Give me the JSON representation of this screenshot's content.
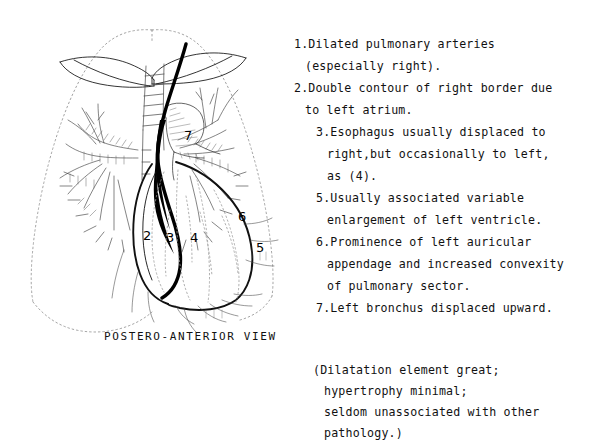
{
  "caption": "POSTERO-ANTERIOR VIEW",
  "legend": {
    "lines": [
      {
        "text": "1.Dilated pulmonary arteries",
        "indent": 0
      },
      {
        "text": "(especially right).",
        "indent": 1
      },
      {
        "text": "2.Double contour of right border due",
        "indent": 0
      },
      {
        "text": "to left atrium.",
        "indent": 1
      },
      {
        "text": "3.Esophagus usually displaced to",
        "indent": 2
      },
      {
        "text": "right,but occasionally to left,",
        "indent": 3
      },
      {
        "text": "as (4).",
        "indent": 3
      },
      {
        "text": "5.Usually associated variable",
        "indent": 2
      },
      {
        "text": "enlargement of left ventricle.",
        "indent": 3
      },
      {
        "text": "6.Prominence of left auricular",
        "indent": 2
      },
      {
        "text": "appendage and increased convexity",
        "indent": 3
      },
      {
        "text": "of pulmonary sector.",
        "indent": 3
      },
      {
        "text": "7.Left bronchus displaced upward.",
        "indent": 2
      }
    ]
  },
  "note": {
    "lines": [
      {
        "text": "(Dilatation element great;",
        "indent": 0
      },
      {
        "text": "hypertrophy minimal;",
        "indent": 1
      },
      {
        "text": "seldom unassociated with other",
        "indent": 1
      },
      {
        "text": "pathology.)",
        "indent": 1
      }
    ]
  },
  "callouts": [
    {
      "label": "2",
      "x": 143,
      "y": 228
    },
    {
      "label": "3",
      "x": 166,
      "y": 230
    },
    {
      "label": "4",
      "x": 190,
      "y": 230
    },
    {
      "label": "5",
      "x": 256,
      "y": 240
    },
    {
      "label": "6",
      "x": 238,
      "y": 209
    },
    {
      "label": "7",
      "x": 184,
      "y": 128
    }
  ],
  "colors": {
    "ink": "#111111",
    "background": "#ffffff",
    "bold_stroke": "#000000",
    "faint_stroke": "#9a9a9a"
  }
}
